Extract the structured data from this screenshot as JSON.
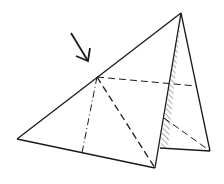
{
  "diagram": {
    "colors": {
      "stroke": "#1a1a1a",
      "background": "#ffffff",
      "hatch": "#555555"
    },
    "points": {
      "apex": [
        181,
        13
      ],
      "left": [
        17,
        139
      ],
      "bottom": [
        155,
        168
      ],
      "mid": [
        97,
        77
      ],
      "dashfoot": [
        82,
        153
      ],
      "right_bottom": [
        210,
        151
      ],
      "shade_bottom": [
        160,
        148
      ],
      "shade_mid": [
        170,
        83
      ],
      "right_mid": [
        196,
        86
      ],
      "shade_low": [
        164,
        118
      ]
    },
    "arrow": {
      "from": [
        71,
        33
      ],
      "to": [
        88,
        61
      ]
    }
  }
}
